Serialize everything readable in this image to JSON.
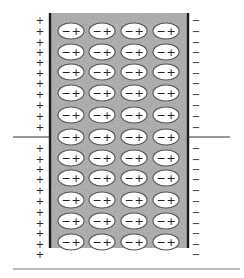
{
  "diagram": {
    "colors": {
      "background": "#ffffff",
      "plate": "#1a1a1a",
      "dielectric": "#b8b8b8",
      "dielectric_speckle": "#8e8e8e",
      "ellipse_fill": "#ffffff",
      "ellipse_stroke": "#555555",
      "charge_text": "#222222",
      "wire": "#333333",
      "baseline": "#777777"
    },
    "left_plate": {
      "x": 50,
      "y_top": 13,
      "y_bottom": 248,
      "charge_symbol": "+",
      "charge_x": 40,
      "charge_y_upper": [
        20,
        31,
        42,
        52,
        62,
        73,
        83,
        94,
        105,
        116,
        127
      ],
      "charge_y_lower": [
        148,
        159,
        169,
        179,
        190,
        201,
        212,
        223,
        233,
        244,
        254
      ]
    },
    "right_plate": {
      "x": 188,
      "y_top": 13,
      "y_bottom": 248,
      "charge_symbol": "−",
      "charge_x": 196,
      "charge_y_upper": [
        20,
        31,
        42,
        52,
        62,
        73,
        83,
        94,
        105,
        116,
        127
      ],
      "charge_y_lower": [
        148,
        159,
        169,
        179,
        190,
        201,
        212,
        223,
        233,
        244,
        254
      ]
    },
    "dielectric": {
      "x": 51,
      "y": 13,
      "width": 136,
      "height": 235
    },
    "dipoles": {
      "columns_x": [
        71,
        102,
        134,
        166
      ],
      "rows_y": [
        31,
        52,
        72,
        93,
        115,
        137,
        158,
        178,
        200,
        221,
        242
      ],
      "rx": 13,
      "ry": 8,
      "neg_label": "−",
      "pos_label": "+"
    },
    "wires": [
      {
        "name": "left-lead-wire",
        "x1": 13,
        "y1": 137,
        "x2": 50,
        "y2": 137
      },
      {
        "name": "right-lead-wire",
        "x1": 188,
        "y1": 137,
        "x2": 230,
        "y2": 137
      }
    ],
    "baseline": {
      "x1": 13,
      "y1": 269,
      "x2": 240,
      "y2": 269
    }
  }
}
